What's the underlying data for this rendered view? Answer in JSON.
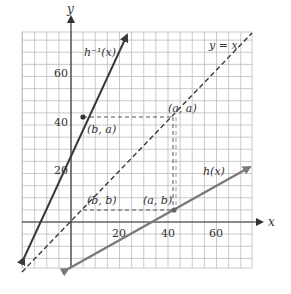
{
  "chart_data": {
    "type": "line",
    "title": "",
    "xlabel": "x",
    "ylabel": "y",
    "xlim": [
      -20,
      75
    ],
    "ylim": [
      -19,
      78
    ],
    "grid": true,
    "grid_step": 5,
    "x_ticks": [
      20,
      40,
      60
    ],
    "y_ticks": [
      20,
      40,
      60
    ],
    "series": [
      {
        "name": "h^-1(x)",
        "label": "h⁻¹(x)",
        "style": "solid",
        "color": "#3a3a3a",
        "points": [
          [
            -20,
            -15.7
          ],
          [
            23.5,
            78
          ]
        ]
      },
      {
        "name": "y = x",
        "label": "y = x",
        "style": "dashed",
        "color": "#3a3a3a",
        "points": [
          [
            -20,
            -20.6
          ],
          [
            74.6,
            78
          ]
        ]
      },
      {
        "name": "h(x)",
        "label": "h(x)",
        "style": "solid",
        "color": "#7a7a7a",
        "points": [
          [
            -1.6,
            -19.8
          ],
          [
            74.6,
            23
          ]
        ]
      }
    ],
    "points": [
      {
        "label": "(b, a)",
        "x": 5,
        "y": 43
      },
      {
        "label": "(a, a)",
        "x": 42,
        "y": 43
      },
      {
        "label": "(b, b)",
        "x": 5,
        "y": 5
      },
      {
        "label": "(a, b)",
        "x": 42,
        "y": 5
      }
    ],
    "annotations": [
      "h⁻¹(x)",
      "y = x",
      "h(x)",
      "(b, a)",
      "(a, a)",
      "(b, b)",
      "(a, b)"
    ]
  },
  "labels": {
    "x_axis": "x",
    "y_axis": "y",
    "tick_x_20": "20",
    "tick_x_40": "40",
    "tick_x_60": "60",
    "tick_y_20": "20",
    "tick_y_40": "40",
    "tick_y_60": "60",
    "hinv": "h⁻¹(x)",
    "yx": "y = x",
    "h": "h(x)",
    "ba": "(b, a)",
    "aa": "(a, a)",
    "bb": "(b, b)",
    "ab": "(a, b)"
  }
}
